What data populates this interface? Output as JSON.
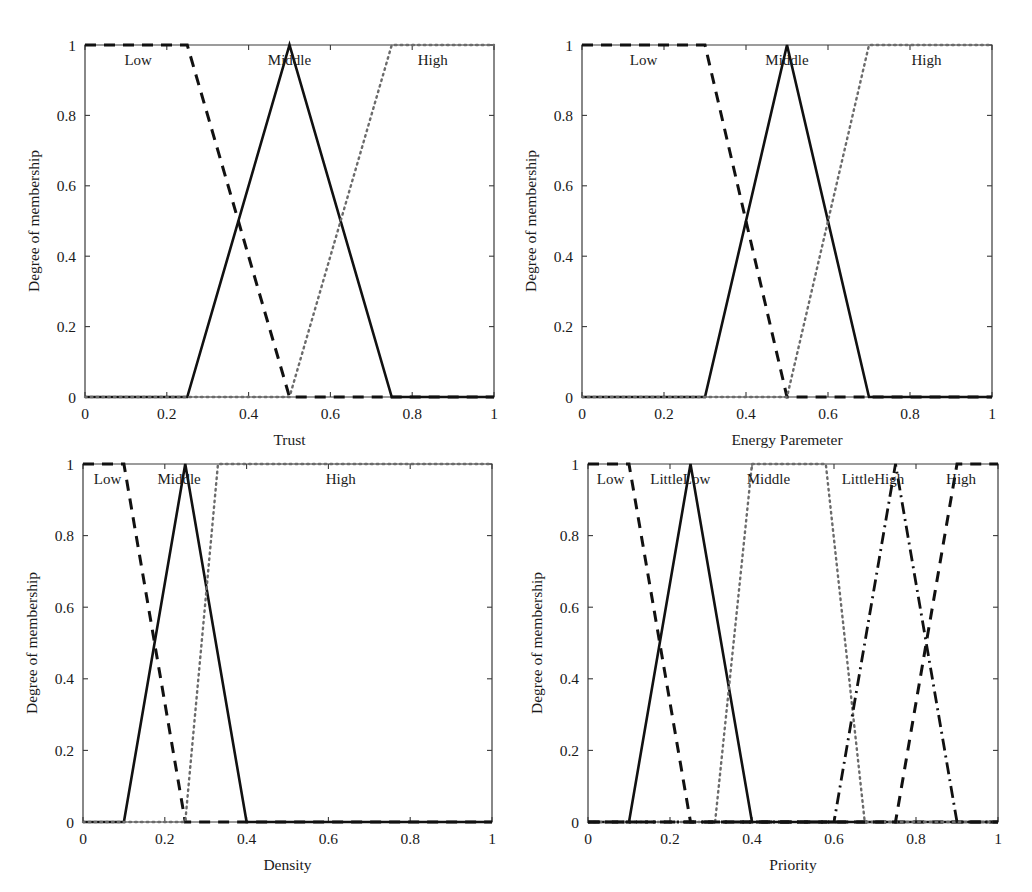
{
  "figure": {
    "title": "",
    "panel_count": 4,
    "y_axis_label": "Degree of membership"
  },
  "chart_data": [
    {
      "type": "line",
      "title": "",
      "xlabel": "Trust",
      "ylabel": "Degree of membership",
      "xlim": [
        0,
        1
      ],
      "ylim": [
        0,
        1
      ],
      "xticks": [
        "0",
        "0.2",
        "0.4",
        "0.6",
        "0.8",
        "1"
      ],
      "xtick_values": [
        0,
        0.2,
        0.4,
        0.6,
        0.8,
        1
      ],
      "yticks": [
        "0",
        "0.2",
        "0.4",
        "0.6",
        "0.8",
        "1"
      ],
      "ytick_values": [
        0,
        0.2,
        0.4,
        0.6,
        0.8,
        1
      ],
      "grid": false,
      "legend_position": "inline-above-curves",
      "series": [
        {
          "name": "Low",
          "style": "dashed",
          "label_x": 0.13,
          "x": [
            0,
            0.25,
            0.5,
            1
          ],
          "y": [
            1,
            1,
            0,
            0
          ]
        },
        {
          "name": "Middle",
          "style": "solid",
          "label_x": 0.5,
          "x": [
            0,
            0.25,
            0.5,
            0.75,
            1
          ],
          "y": [
            0,
            0,
            1,
            0,
            0
          ]
        },
        {
          "name": "High",
          "style": "dotted",
          "label_x": 0.85,
          "x": [
            0,
            0.5,
            0.75,
            1
          ],
          "y": [
            0,
            0,
            1,
            1
          ]
        }
      ]
    },
    {
      "type": "line",
      "title": "",
      "xlabel": "Energy Paremeter",
      "ylabel": "Degree of membership",
      "xlim": [
        0,
        1
      ],
      "ylim": [
        0,
        1
      ],
      "xticks": [
        "0",
        "0.2",
        "0.4",
        "0.6",
        "0.8",
        "1"
      ],
      "xtick_values": [
        0,
        0.2,
        0.4,
        0.6,
        0.8,
        1
      ],
      "yticks": [
        "0",
        "0.2",
        "0.4",
        "0.6",
        "0.8",
        "1"
      ],
      "ytick_values": [
        0,
        0.2,
        0.4,
        0.6,
        0.8,
        1
      ],
      "grid": false,
      "legend_position": "inline-above-curves",
      "series": [
        {
          "name": "Low",
          "style": "dashed",
          "label_x": 0.15,
          "x": [
            0,
            0.3,
            0.5,
            1
          ],
          "y": [
            1,
            1,
            0,
            0
          ]
        },
        {
          "name": "Middle",
          "style": "solid",
          "label_x": 0.5,
          "x": [
            0,
            0.3,
            0.5,
            0.7,
            1
          ],
          "y": [
            0,
            0,
            1,
            0,
            0
          ]
        },
        {
          "name": "High",
          "style": "dotted",
          "label_x": 0.84,
          "x": [
            0,
            0.5,
            0.7,
            1
          ],
          "y": [
            0,
            0,
            1,
            1
          ]
        }
      ]
    },
    {
      "type": "line",
      "title": "",
      "xlabel": "Density",
      "ylabel": "Degree of membership",
      "xlim": [
        0,
        1
      ],
      "ylim": [
        0,
        1
      ],
      "xticks": [
        "0",
        "0.2",
        "0.4",
        "0.6",
        "0.8",
        "1"
      ],
      "xtick_values": [
        0,
        0.2,
        0.4,
        0.6,
        0.8,
        1
      ],
      "yticks": [
        "0",
        "0.2",
        "0.4",
        "0.6",
        "0.8",
        "1"
      ],
      "ytick_values": [
        0,
        0.2,
        0.4,
        0.6,
        0.8,
        1
      ],
      "grid": false,
      "legend_position": "inline-above-curves",
      "series": [
        {
          "name": "Low",
          "style": "dashed",
          "label_x": 0.06,
          "x": [
            0,
            0.1,
            0.25,
            1
          ],
          "y": [
            1,
            1,
            0,
            0
          ]
        },
        {
          "name": "Middle",
          "style": "solid",
          "label_x": 0.235,
          "x": [
            0,
            0.1,
            0.25,
            0.4,
            1
          ],
          "y": [
            0,
            0,
            1,
            0,
            0
          ]
        },
        {
          "name": "High",
          "style": "dotted",
          "label_x": 0.63,
          "x": [
            0,
            0.25,
            0.33,
            1
          ],
          "y": [
            0,
            0,
            1,
            1
          ]
        }
      ]
    },
    {
      "type": "line",
      "title": "",
      "xlabel": "Priority",
      "ylabel": "Degree of membership",
      "xlim": [
        0,
        1
      ],
      "ylim": [
        0,
        1
      ],
      "xticks": [
        "0",
        "0.2",
        "0.4",
        "0.6",
        "0.8",
        "1"
      ],
      "xtick_values": [
        0,
        0.2,
        0.4,
        0.6,
        0.8,
        1
      ],
      "yticks": [
        "0",
        "0.2",
        "0.4",
        "0.6",
        "0.8",
        "1"
      ],
      "ytick_values": [
        0,
        0.2,
        0.4,
        0.6,
        0.8,
        1
      ],
      "grid": false,
      "legend_position": "inline-above-curves",
      "series": [
        {
          "name": "Low",
          "style": "dashed",
          "label_x": 0.055,
          "x": [
            0,
            0.1,
            0.25,
            1
          ],
          "y": [
            1,
            1,
            0,
            0
          ]
        },
        {
          "name": "LittleLow",
          "style": "solid",
          "label_x": 0.225,
          "x": [
            0,
            0.1,
            0.25,
            0.4,
            1
          ],
          "y": [
            0,
            0,
            1,
            0,
            0
          ]
        },
        {
          "name": "Middle",
          "style": "dotted",
          "label_x": 0.44,
          "x": [
            0,
            0.31,
            0.4,
            0.58,
            0.675,
            1
          ],
          "y": [
            0,
            0,
            1,
            1,
            0,
            0
          ]
        },
        {
          "name": "LittleHigh",
          "style": "dashdot",
          "label_x": 0.695,
          "x": [
            0,
            0.6,
            0.75,
            0.9,
            1
          ],
          "y": [
            0,
            0,
            1,
            0,
            0
          ]
        },
        {
          "name": "High",
          "style": "dashed",
          "label_x": 0.91,
          "x": [
            0,
            0.75,
            0.9,
            1
          ],
          "y": [
            0,
            0,
            1,
            1
          ]
        }
      ]
    }
  ]
}
